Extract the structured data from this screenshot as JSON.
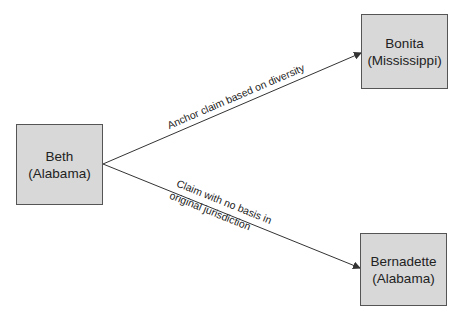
{
  "nodes": {
    "beth": {
      "name": "Beth",
      "state": "(Alabama)"
    },
    "bonita": {
      "name": "Bonita",
      "state": "(Mississippi)"
    },
    "bernadette": {
      "name": "Bernadette",
      "state": "(Alabama)"
    }
  },
  "edges": {
    "to_bonita": {
      "label": "Anchor claim based on diversity"
    },
    "to_bernadette": {
      "line1": "Claim with no basis in",
      "line2": "original jurisdiction"
    }
  },
  "colors": {
    "box_fill": "#d8d8d8",
    "box_border": "#555555",
    "line": "#333333"
  }
}
